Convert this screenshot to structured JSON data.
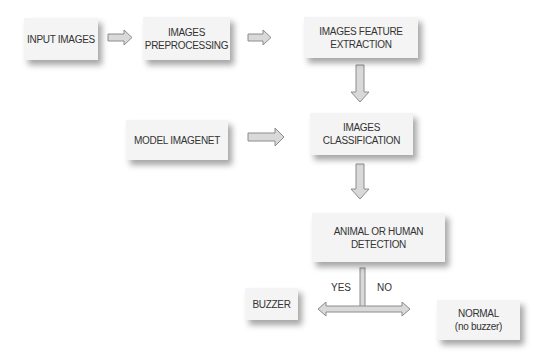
{
  "diagram": {
    "type": "flowchart",
    "nodes": [
      {
        "id": "input",
        "label": "INPUT IMAGES"
      },
      {
        "id": "preprocess",
        "label": "IMAGES\nPREPROCESSING"
      },
      {
        "id": "feature",
        "label": "IMAGES FEATURE\nEXTRACTION"
      },
      {
        "id": "model",
        "label": "MODEL IMAGENET"
      },
      {
        "id": "classify",
        "label": "IMAGES\nCLASSIFICATION"
      },
      {
        "id": "detect",
        "label": "ANIMAL OR HUMAN\nDETECTION"
      },
      {
        "id": "buzzer",
        "label": "BUZZER"
      },
      {
        "id": "normal",
        "label": "NORMAL\n(no buzzer)"
      }
    ],
    "edges": [
      {
        "from": "input",
        "to": "preprocess"
      },
      {
        "from": "preprocess",
        "to": "feature"
      },
      {
        "from": "feature",
        "to": "classify"
      },
      {
        "from": "model",
        "to": "classify"
      },
      {
        "from": "classify",
        "to": "detect"
      },
      {
        "from": "detect",
        "to": "buzzer",
        "label": "YES"
      },
      {
        "from": "detect",
        "to": "normal",
        "label": "NO"
      }
    ],
    "branch_labels": {
      "yes": "YES",
      "no": "NO"
    },
    "colors": {
      "box_fill": "#f4f4f4",
      "arrow_fill": "#d9d9d9",
      "arrow_stroke": "#8c8c8c",
      "text": "#333333"
    }
  }
}
